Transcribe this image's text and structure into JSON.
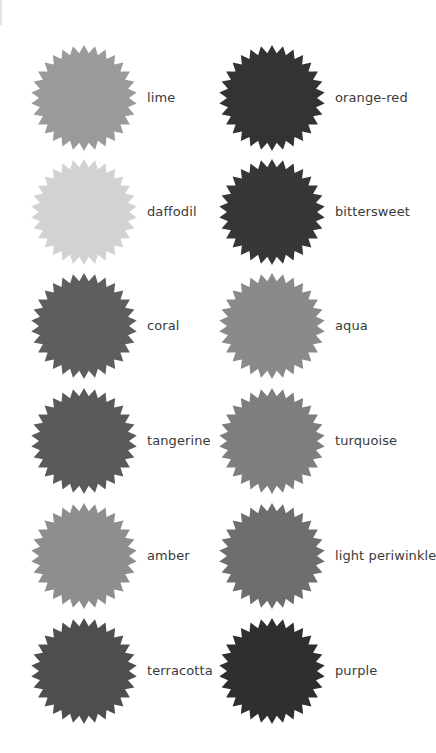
{
  "swatches": [
    {
      "label": "lime",
      "color": "#9a9a9a",
      "column": 0,
      "row": 0
    },
    {
      "label": "orange-red",
      "color": "#333333",
      "column": 1,
      "row": 0
    },
    {
      "label": "daffodil",
      "color": "#d2d2d2",
      "column": 0,
      "row": 1
    },
    {
      "label": "bittersweet",
      "color": "#363636",
      "column": 1,
      "row": 1
    },
    {
      "label": "coral",
      "color": "#5e5e5e",
      "column": 0,
      "row": 2
    },
    {
      "label": "aqua",
      "color": "#8a8a8a",
      "column": 1,
      "row": 2
    },
    {
      "label": "tangerine",
      "color": "#5a5a5a",
      "column": 0,
      "row": 3
    },
    {
      "label": "turquoise",
      "color": "#7e7e7e",
      "column": 1,
      "row": 3
    },
    {
      "label": "amber",
      "color": "#8e8e8e",
      "column": 0,
      "row": 4
    },
    {
      "label": "light periwinkle",
      "color": "#6e6e6e",
      "column": 1,
      "row": 4
    },
    {
      "label": "terracotta",
      "color": "#4e4e4e",
      "column": 0,
      "row": 5
    },
    {
      "label": "purple",
      "color": "#2f2f2f",
      "column": 1,
      "row": 5
    }
  ],
  "layout": {
    "column_x": [
      30,
      218
    ],
    "row_y": [
      44,
      158,
      272,
      387,
      502,
      617
    ],
    "star_points": 30,
    "outer_radius": 53,
    "inner_radius": 45
  }
}
